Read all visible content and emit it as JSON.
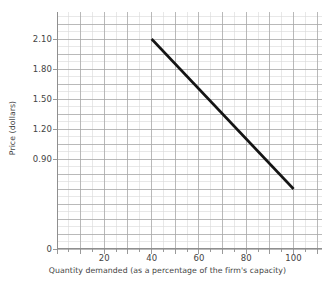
{
  "chart_data": {
    "type": "line",
    "title": "",
    "subtitle": "",
    "xlabel": "Quantity demanded (as a percentage of the firm's capacity)",
    "ylabel": "Price (dollars)",
    "xlim": [
      0,
      112
    ],
    "ylim": [
      0,
      2.37
    ],
    "grid": true,
    "legend": null,
    "x_ticks": [
      {
        "value": 20,
        "label": "20"
      },
      {
        "value": 40,
        "label": "40"
      },
      {
        "value": 60,
        "label": "60"
      },
      {
        "value": 80,
        "label": "80"
      },
      {
        "value": 100,
        "label": "100"
      }
    ],
    "y_ticks": [
      {
        "value": 0,
        "label": "0"
      },
      {
        "value": 0.9,
        "label": "0.90"
      },
      {
        "value": 1.2,
        "label": "1.20"
      },
      {
        "value": 1.5,
        "label": "1.50"
      },
      {
        "value": 1.8,
        "label": "1.80"
      },
      {
        "value": 2.1,
        "label": "2.10"
      }
    ],
    "series": [
      {
        "name": "Demand",
        "color": "#141414",
        "x": [
          40,
          100
        ],
        "values": [
          2.1,
          0.6
        ],
        "points": [
          {
            "x": 40,
            "y": 2.1
          },
          {
            "x": 100,
            "y": 0.6
          }
        ]
      }
    ],
    "grid_minor_x_step": 5,
    "grid_minor_y_step": 0.075,
    "grid_major_x_step": 10,
    "grid_major_y_step": 0.15,
    "colors": {
      "minor_grid": "#d8d8d8",
      "major_grid": "#a8a8a8",
      "axis": "#8f8f8f",
      "line": "#141414",
      "text": "#434343",
      "background": "#ffffff"
    }
  }
}
